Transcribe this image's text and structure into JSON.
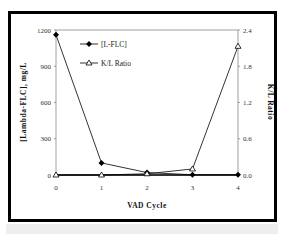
{
  "chart_data": {
    "type": "line",
    "title": "",
    "xlabel": "VAD Cycle",
    "ylabel": "[Lambda-FLC], mg/L",
    "y2label": "K/L Ratio",
    "x": [
      0,
      1,
      2,
      3,
      4
    ],
    "x_tick_labels": [
      "0",
      "1",
      "2",
      "3",
      "4"
    ],
    "ylim": [
      0,
      1200
    ],
    "y_ticks": [
      "0",
      "300",
      "600",
      "900",
      "1200"
    ],
    "y2lim": [
      0,
      2.4
    ],
    "y2_ticks": [
      "0.0",
      "0.6",
      "1.2",
      "1.8",
      "2.4"
    ],
    "grid": false,
    "legend_position": "upper-left-inside",
    "series": [
      {
        "name": "[L-FLC]",
        "axis": "left",
        "marker": "diamond-filled",
        "values": [
          1160,
          100,
          20,
          2,
          2
        ]
      },
      {
        "name": "K/L Ratio",
        "axis": "right",
        "marker": "triangle-open",
        "values": [
          0.0,
          0.0,
          0.02,
          0.1,
          2.13
        ]
      }
    ]
  },
  "legend": {
    "items": [
      {
        "label": "[L-FLC]"
      },
      {
        "label": "K/L Ratio"
      }
    ]
  },
  "axes": {
    "x_title": "VAD Cycle",
    "y_left_title": "[Lambda-FLC], mg/L",
    "y_right_title": "K/L Ratio"
  }
}
